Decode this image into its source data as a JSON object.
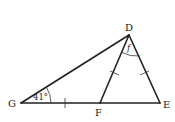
{
  "diagram": {
    "type": "geometry-triangle",
    "points": {
      "D": "D",
      "E": "E",
      "F": "F",
      "G": "G"
    },
    "segments": [
      "GD",
      "GE",
      "DF",
      "DE"
    ],
    "angles": {
      "G": "41°",
      "FDE": "f"
    },
    "congruent_marks": [
      "GF",
      "DF",
      "DE"
    ]
  }
}
